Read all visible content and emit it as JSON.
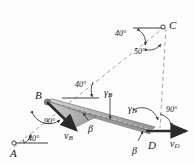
{
  "figure": {
    "name": "four-bar-mechanism-velocity-diagram",
    "type": "engineering-mechanics-diagram",
    "background": "#fdfdfd",
    "ink": "#1b1b1b",
    "bar_fill": "#a8a8a8",
    "bar_edge": "#5a5a5a",
    "dash_color": "#9a9a9a",
    "arrow_color": "#2b2b2b"
  },
  "points": {
    "A": {
      "label": "A",
      "x": 14,
      "y": 147,
      "pin": true
    },
    "B": {
      "label": "B",
      "x": 45,
      "y": 101,
      "pin": true
    },
    "C": {
      "label": "C",
      "x": 166,
      "y": 26,
      "pin": true
    },
    "D": {
      "label": "D",
      "x": 149,
      "y": 130,
      "pin": true
    }
  },
  "angles": {
    "at_A": {
      "value": "40°",
      "x": 25,
      "y": 141
    },
    "at_B_horizontal": {
      "value": "40°",
      "x": 78,
      "y": 86
    },
    "at_B_velocity": {
      "value": "90°",
      "x": 51,
      "y": 123
    },
    "at_C_upper": {
      "value": "40°",
      "x": 120,
      "y": 35
    },
    "at_C_lower": {
      "value": "50°",
      "x": 139,
      "y": 54
    },
    "at_D_right": {
      "value": "90°",
      "x": 170,
      "y": 112
    }
  },
  "greek": {
    "gamma_B": {
      "letter": "γ",
      "sub": "B",
      "x": 106,
      "y": 89
    },
    "gamma_D": {
      "letter": "γ",
      "sub": "D",
      "x": 131,
      "y": 105
    },
    "beta_B": {
      "letter": "β",
      "x": 86,
      "y": 124
    },
    "beta_D": {
      "letter": "β",
      "x": 133,
      "y": 146
    }
  },
  "vectors": {
    "v_B": {
      "letter": "v",
      "sub": "B",
      "x": 69,
      "y": 135,
      "description": "velocity of point B"
    },
    "v_D": {
      "letter": "v",
      "sub": "D",
      "x": 174,
      "y": 143,
      "description": "velocity of point D"
    }
  },
  "elements": {
    "link_AB": "dashed line from A through B to C",
    "link_BD": "solid shaded slender bar from B to D",
    "vertical_CD": "vertical dashed line from C down through D"
  }
}
